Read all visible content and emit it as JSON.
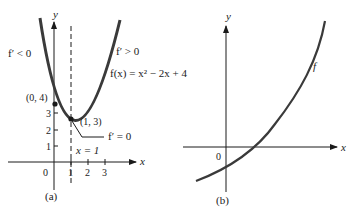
{
  "graph_a": {
    "caption": "(a)",
    "axis_x_label": "x",
    "axis_y_label": "y",
    "left_label": "f′ < 0",
    "right_label": "f′ > 0",
    "function_label": "f(x) = x² − 2x + 4",
    "point_intercept": "(0, 4)",
    "point_vertex": "(1, 3)",
    "vertex_annotation": "f′ = 0",
    "line_label": "x = 1",
    "origin": "0",
    "x_ticks": [
      "1",
      "2",
      "3"
    ],
    "y_ticks": [
      "1",
      "2",
      "3"
    ]
  },
  "graph_b": {
    "caption": "(b)",
    "axis_x_label": "x",
    "axis_y_label": "y",
    "curve_label": "f",
    "origin": "0"
  },
  "colors": {
    "curve": "#3a3a3a",
    "ink": "#1a1a1a"
  }
}
